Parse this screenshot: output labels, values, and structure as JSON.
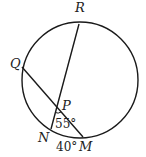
{
  "diagram": {
    "type": "circle-with-intersecting-chords",
    "circle": {
      "cx": 80,
      "cy": 80,
      "r": 58
    },
    "points": {
      "R": {
        "label": "R",
        "x": 79,
        "y": 24
      },
      "Q": {
        "label": "Q",
        "x": 22,
        "y": 67
      },
      "N": {
        "label": "N",
        "x": 51,
        "y": 129
      },
      "M": {
        "label": "M",
        "x": 83,
        "y": 137
      },
      "P": {
        "label": "P",
        "x": 57,
        "y": 107
      }
    },
    "chords": [
      {
        "from": "R",
        "to": "N"
      },
      {
        "from": "Q",
        "to": "M"
      }
    ],
    "angles": [
      {
        "at": "P",
        "label": "55°"
      }
    ],
    "arcs": [
      {
        "from": "N",
        "to": "M",
        "label": "40°"
      }
    ],
    "colors": {
      "stroke": "#1a1a1a",
      "background": "#ffffff"
    }
  }
}
